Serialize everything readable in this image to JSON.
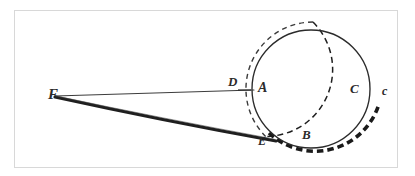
{
  "figure": {
    "background_color": "#ffffff",
    "frame_color": "#d8d8d8",
    "ink_color": "#2b2b2b",
    "labels": [
      {
        "text": "F",
        "name": "point-label-f",
        "x": 48,
        "y": 87,
        "size": 15
      },
      {
        "text": "D",
        "name": "point-label-d",
        "x": 228,
        "y": 75,
        "size": 13
      },
      {
        "text": "A",
        "name": "point-label-a",
        "x": 258,
        "y": 81,
        "size": 14
      },
      {
        "text": "C",
        "name": "point-label-c-upper",
        "x": 350,
        "y": 82,
        "size": 13
      },
      {
        "text": "c",
        "name": "point-label-c-lower",
        "x": 382,
        "y": 85,
        "size": 12
      },
      {
        "text": "B",
        "name": "point-label-b",
        "x": 302,
        "y": 128,
        "size": 13
      },
      {
        "text": "E",
        "name": "point-label-e",
        "x": 258,
        "y": 135,
        "size": 12
      }
    ],
    "geometry": {
      "solid_circle": {
        "cx": 311,
        "cy": 89,
        "r": 59
      },
      "dashed_circle": {
        "cx": 313,
        "cy": 89,
        "r": 67
      },
      "point_f": {
        "x": 54,
        "y": 95
      },
      "point_d": {
        "x": 246,
        "y": 90
      },
      "point_a": {
        "x": 253,
        "y": 90
      },
      "point_e": {
        "x": 268,
        "y": 137
      },
      "point_b": {
        "x": 308,
        "y": 147
      },
      "thin_line_label": "F to A through D",
      "thick_line_label": "F to E tangent"
    }
  }
}
